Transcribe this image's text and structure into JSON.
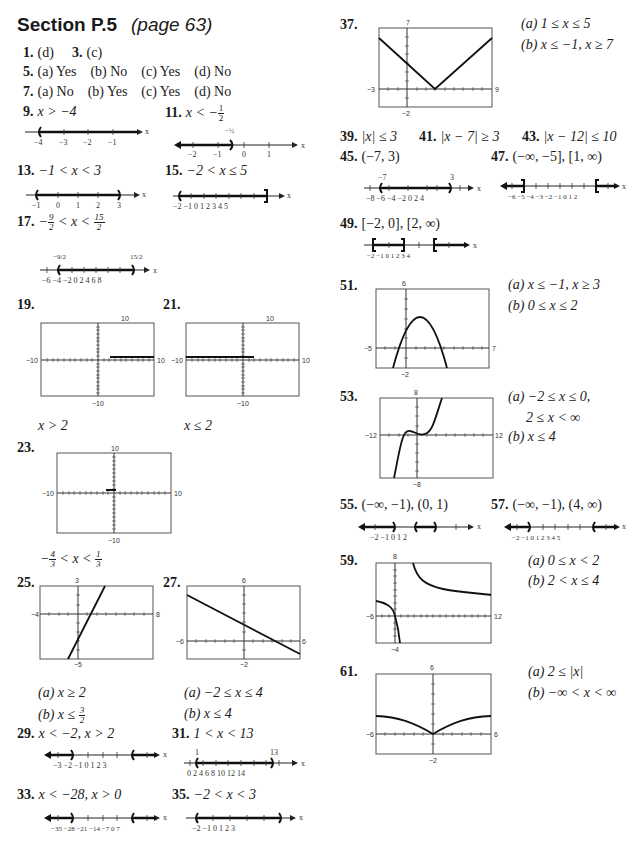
{
  "header": {
    "section": "Section P.5",
    "page": "(page 63)"
  },
  "answers": {
    "a1": {
      "num": "1.",
      "text": "(d)"
    },
    "a3": {
      "num": "3.",
      "text": "(c)"
    },
    "a5": {
      "num": "5.",
      "parts": [
        "(a) Yes",
        "(b) No",
        "(c) Yes",
        "(d) No"
      ]
    },
    "a7": {
      "num": "7.",
      "parts": [
        "(a) No",
        "(b) Yes",
        "(c) Yes",
        "(d) No"
      ]
    },
    "a9": {
      "num": "9.",
      "text": "x > −4",
      "ticks": [
        "−4",
        "−3",
        "−2",
        "−1"
      ]
    },
    "a11": {
      "num": "11.",
      "text": "x < −",
      "frac": [
        "1",
        "2"
      ],
      "ticks": [
        "−2",
        "−1",
        "0",
        "1"
      ],
      "label": "−1/2"
    },
    "a13": {
      "num": "13.",
      "text": "−1 < x < 3",
      "ticks": [
        "−1",
        "0",
        "1",
        "2",
        "3"
      ]
    },
    "a15": {
      "num": "15.",
      "text": "−2 < x ≤ 5",
      "ticks": [
        "−2",
        "−1",
        "0",
        "1",
        "2",
        "3",
        "4",
        "5"
      ]
    },
    "a17": {
      "num": "17.",
      "text": "− 9/2 < x < 15/2",
      "ticks": [
        "−6",
        "−4",
        "−2",
        "0",
        "2",
        "4",
        "6",
        "8"
      ],
      "labels": [
        "−9/2",
        "15/2"
      ]
    },
    "a19": {
      "num": "19.",
      "caption": "x > 2",
      "window": {
        "top": "10",
        "bottom": "−10",
        "left": "−10",
        "right": "10"
      }
    },
    "a21": {
      "num": "21.",
      "caption": "x ≤ 2",
      "window": {
        "top": "10",
        "bottom": "−10",
        "left": "−10",
        "right": "10"
      }
    },
    "a23": {
      "num": "23.",
      "caption": "−4/3 < x < 1/3",
      "window": {
        "top": "10",
        "bottom": "−10",
        "left": "−10",
        "right": "10"
      }
    },
    "a25": {
      "num": "25.",
      "a": "(a) x ≥ 2",
      "b": "(b) x ≤ 3/2",
      "window": {
        "top": "3",
        "bottom": "−5",
        "left": "−4",
        "right": "8"
      }
    },
    "a27": {
      "num": "27.",
      "a": "(a) −2 ≤ x ≤ 4",
      "b": "(b) x ≤ 4",
      "window": {
        "top": "6",
        "bottom": "−2",
        "left": "−6",
        "right": "6"
      }
    },
    "a29": {
      "num": "29.",
      "text": "x < −2, x > 2",
      "ticks": [
        "−3",
        "−2",
        "−1",
        "0",
        "1",
        "2",
        "3"
      ]
    },
    "a31": {
      "num": "31.",
      "text": "1 < x < 13",
      "ticks": [
        "0",
        "2",
        "4",
        "6",
        "8",
        "10",
        "12",
        "14"
      ],
      "labels": [
        "1",
        "13"
      ]
    },
    "a33": {
      "num": "33.",
      "text": "x < −28, x > 0",
      "ticks": [
        "−35",
        "−28",
        "−21",
        "−14",
        "−7",
        "0",
        "7"
      ]
    },
    "a35": {
      "num": "35.",
      "text": "−2 < x < 3",
      "ticks": [
        "−2",
        "−1",
        "0",
        "1",
        "2",
        "3"
      ]
    },
    "a37": {
      "num": "37.",
      "a": "(a) 1 ≤ x ≤ 5",
      "b": "(b) x ≤ −1, x ≥ 7",
      "window": {
        "top": "7",
        "bottom": "−2",
        "left": "−3",
        "right": "9"
      }
    },
    "a39": {
      "num": "39.",
      "text": "|x| ≤ 3"
    },
    "a41": {
      "num": "41.",
      "text": "|x − 7| ≥ 3"
    },
    "a43": {
      "num": "43.",
      "text": "|x − 12| ≤ 10"
    },
    "a45": {
      "num": "45.",
      "text": "(−7, 3)",
      "ticks": [
        "−8",
        "−6",
        "−4",
        "−2",
        "0",
        "2",
        "4"
      ],
      "labels": [
        "−7",
        "3"
      ]
    },
    "a47": {
      "num": "47.",
      "text": "(−∞, −5], [1, ∞)",
      "ticks": [
        "−6",
        "−5",
        "−4",
        "−3",
        "−2",
        "−1",
        "0",
        "1",
        "2"
      ]
    },
    "a49": {
      "num": "49.",
      "text": "[−2, 0], [2, ∞)",
      "ticks": [
        "−2",
        "−1",
        "0",
        "1",
        "2",
        "3",
        "4"
      ]
    },
    "a51": {
      "num": "51.",
      "a": "(a) x ≤ −1, x ≥ 3",
      "b": "(b) 0 ≤ x ≤ 2",
      "window": {
        "top": "6",
        "bottom": "−2",
        "left": "−5",
        "right": "7"
      }
    },
    "a53": {
      "num": "53.",
      "a": "(a) −2 ≤ x ≤ 0,",
      "a2": "2 ≤ x < ∞",
      "b": "(b) x ≤ 4",
      "window": {
        "top": "8",
        "bottom": "−8",
        "left": "−12",
        "right": "12"
      }
    },
    "a55": {
      "num": "55.",
      "text": "(−∞, −1), (0, 1)",
      "ticks": [
        "−2",
        "−1",
        "0",
        "1",
        "2"
      ]
    },
    "a57": {
      "num": "57.",
      "text": "(−∞, −1), (4, ∞)",
      "ticks": [
        "−2",
        "−1",
        "0",
        "1",
        "2",
        "3",
        "4",
        "5"
      ]
    },
    "a59": {
      "num": "59.",
      "a": "(a) 0 ≤ x < 2",
      "b": "(b) 2 < x ≤ 4",
      "window": {
        "top": "8",
        "bottom": "−4",
        "left": "−6",
        "right": "12"
      }
    },
    "a61": {
      "num": "61.",
      "a": "(a) 2 ≤ |x|",
      "b": "(b) −∞ < x < ∞",
      "window": {
        "top": "6",
        "bottom": "−2",
        "left": "−6",
        "right": "6"
      }
    }
  },
  "axis_label": "x"
}
